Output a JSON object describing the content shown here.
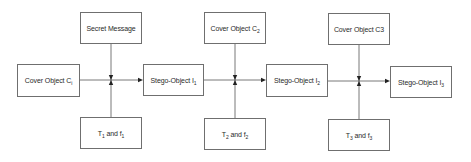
{
  "diagram": {
    "type": "flow",
    "line_color": "#555555",
    "box_border_color": "#6f6f6f",
    "nodes": [
      {
        "id": "cover1",
        "text": "Cover Object C",
        "sub": "i",
        "x": 17,
        "y": 64,
        "w": 63,
        "h": 33
      },
      {
        "id": "secret",
        "text": "Secret Message",
        "sub": "",
        "x": 80,
        "y": 12,
        "w": 62,
        "h": 32
      },
      {
        "id": "key1",
        "text": "T",
        "sub": "1",
        "text2": " and f",
        "sub2": "1",
        "x": 80,
        "y": 117,
        "w": 62,
        "h": 32
      },
      {
        "id": "stego1",
        "text": "Stego-Object I",
        "sub": "1",
        "x": 143,
        "y": 64,
        "w": 61,
        "h": 32
      },
      {
        "id": "cover2",
        "text": "Cover Object C",
        "sub": "2",
        "x": 204,
        "y": 12,
        "w": 62,
        "h": 32
      },
      {
        "id": "key2",
        "text": "T",
        "sub": "2",
        "text2": " and f",
        "sub2": "2",
        "x": 204,
        "y": 118,
        "w": 62,
        "h": 32
      },
      {
        "id": "stego2",
        "text": "Stego-Object I",
        "sub": "2",
        "x": 266,
        "y": 64,
        "w": 62,
        "h": 33
      },
      {
        "id": "cover3",
        "text": "Cover Object C3",
        "sub": "",
        "x": 328,
        "y": 13,
        "w": 62,
        "h": 32
      },
      {
        "id": "key3",
        "text": "T",
        "sub": "3",
        "text2": " and f",
        "sub2": "3",
        "x": 328,
        "y": 119,
        "w": 62,
        "h": 32
      },
      {
        "id": "stego3",
        "text": "Stego-Object I",
        "sub": "3",
        "x": 390,
        "y": 66,
        "w": 62,
        "h": 32
      }
    ],
    "junctions": [
      {
        "x": 111,
        "y": 80,
        "from_left": 80,
        "to_right": 143,
        "top": 44,
        "bottom": 117
      },
      {
        "x": 235,
        "y": 80,
        "from_left": 204,
        "to_right": 266,
        "top": 44,
        "bottom": 118
      },
      {
        "x": 359,
        "y": 81,
        "from_left": 328,
        "to_right": 390,
        "top": 45,
        "bottom": 119
      }
    ]
  }
}
